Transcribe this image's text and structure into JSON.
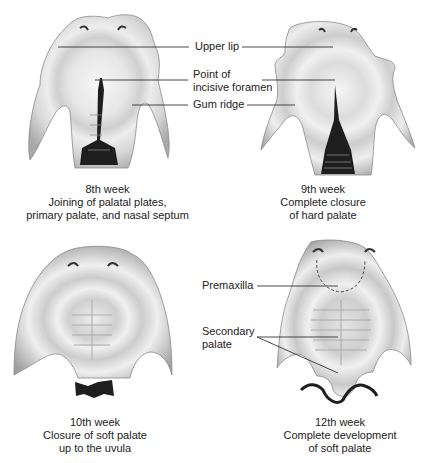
{
  "figure": {
    "panels": [
      {
        "id": "week8",
        "caption_lines": [
          "8th week",
          "Joining of palatal plates,",
          "primary palate, and nasal septum"
        ]
      },
      {
        "id": "week9",
        "caption_lines": [
          "9th week",
          "Complete closure",
          "of hard palate"
        ]
      },
      {
        "id": "week10",
        "caption_lines": [
          "10th week",
          "Closure of soft palate",
          "up to the uvula"
        ]
      },
      {
        "id": "week12",
        "caption_lines": [
          "12th week",
          "Complete development",
          "of soft palate"
        ]
      }
    ],
    "labels_top": {
      "upper_lip": "Upper lip",
      "incisive_foramen_line1": "Point of",
      "incisive_foramen_line2": "incisive foramen",
      "gum_ridge": "Gum ridge"
    },
    "labels_bottom": {
      "premaxilla": "Premaxilla",
      "secondary_palate_line1": "Secondary",
      "secondary_palate_line2": "palate"
    },
    "colors": {
      "tissue_light": "#f2f2f2",
      "tissue_mid": "#d4d4d4",
      "tissue_dark": "#a8a8a8",
      "cleft_dark": "#1e1e1e",
      "line": "#333333"
    }
  }
}
